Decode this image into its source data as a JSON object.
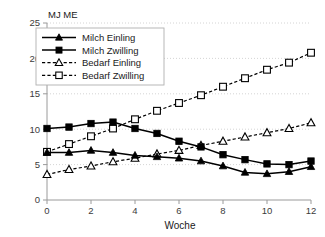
{
  "chart_data": {
    "type": "line",
    "title": "",
    "xlabel": "Woche",
    "ylabel": "",
    "unit_label": "MJ ME",
    "x": [
      0,
      1,
      2,
      3,
      4,
      5,
      6,
      7,
      8,
      9,
      10,
      11,
      12
    ],
    "xlim": [
      0,
      12
    ],
    "ylim": [
      0,
      25
    ],
    "xticks": [
      "0",
      "2",
      "4",
      "6",
      "8",
      "10",
      "12"
    ],
    "xtick_values": [
      0,
      2,
      4,
      6,
      8,
      10,
      12
    ],
    "yticks": [
      "0",
      "5",
      "10",
      "15",
      "20",
      "25"
    ],
    "ytick_values": [
      0,
      5,
      10,
      15,
      20,
      25
    ],
    "grid": true,
    "grid_axis": "y",
    "legend_position": "upper left",
    "series": [
      {
        "name": "Milch Einling",
        "marker": "filled-triangle",
        "linestyle": "solid",
        "color": "#000000",
        "values": [
          6.7,
          6.7,
          7.0,
          6.7,
          6.3,
          6.1,
          5.9,
          5.5,
          4.8,
          3.9,
          3.7,
          4.0,
          4.7
        ]
      },
      {
        "name": "Milch Zwilling",
        "marker": "filled-square",
        "linestyle": "solid",
        "color": "#000000",
        "values": [
          10.1,
          10.3,
          10.8,
          11.0,
          10.1,
          9.4,
          8.3,
          7.5,
          6.4,
          5.7,
          5.1,
          5.0,
          5.5
        ]
      },
      {
        "name": "Bedarf Einling",
        "marker": "open-triangle",
        "linestyle": "dashed",
        "color": "#000000",
        "values": [
          3.6,
          4.3,
          4.8,
          5.4,
          5.9,
          6.5,
          7.0,
          7.7,
          8.3,
          8.9,
          9.5,
          10.1,
          10.9
        ]
      },
      {
        "name": "Bedarf Zwilling",
        "marker": "open-square",
        "linestyle": "dashed",
        "color": "#000000",
        "values": [
          6.8,
          7.9,
          9.0,
          10.1,
          11.4,
          12.6,
          13.7,
          14.8,
          16.0,
          17.2,
          18.4,
          19.4,
          20.8
        ]
      }
    ]
  },
  "legend": {
    "items": [
      {
        "label": "Milch Einling"
      },
      {
        "label": "Milch Zwilling"
      },
      {
        "label": "Bedarf Einling"
      },
      {
        "label": "Bedarf Zwilling"
      }
    ]
  },
  "axes": {
    "x_title": "Woche",
    "y_unit": "MJ ME"
  },
  "colors": {
    "series": "#000000",
    "axis": "#9a9a9a",
    "grid": "#c9c9c9",
    "background": "#ffffff",
    "text": "#1a1a1a"
  }
}
